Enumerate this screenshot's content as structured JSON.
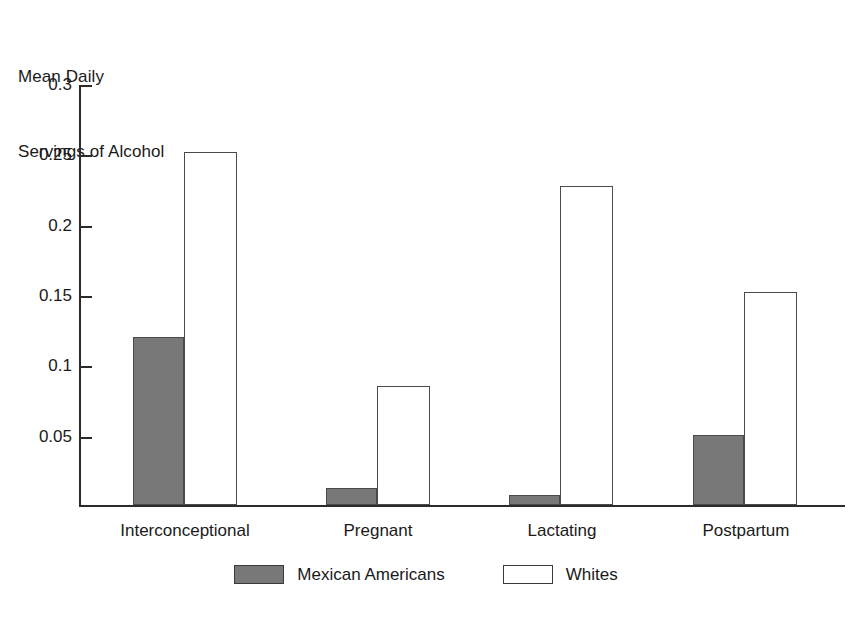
{
  "chart_data": {
    "type": "bar",
    "title": "",
    "ylabel": "Mean Daily Servings of Alcohol",
    "ylabel_line1": "Mean Daily",
    "ylabel_line2": "Servings of Alcohol",
    "xlabel": "",
    "categories": [
      "Interconceptional",
      "Pregnant",
      "Lactating",
      "Postpartum"
    ],
    "ylim": [
      0,
      0.3
    ],
    "ytick_labels": [
      "0.05",
      "0.1",
      "0.15",
      "0.2",
      "0.25",
      "0.3"
    ],
    "ytick_values": [
      0.05,
      0.1,
      0.15,
      0.2,
      0.25,
      0.3
    ],
    "grid": false,
    "legend_position": "bottom-center",
    "series": [
      {
        "name": "Mexican Americans",
        "color": "#787878",
        "style": "filled-gray",
        "values": [
          0.12,
          0.012,
          0.007,
          0.05
        ]
      },
      {
        "name": "Whites",
        "color": "#ffffff",
        "style": "outlined-white",
        "values": [
          0.252,
          0.085,
          0.228,
          0.152
        ]
      }
    ]
  },
  "axis": {
    "line_color": "#2b2b2b"
  },
  "legend": {
    "items": [
      {
        "label": "Mexican Americans",
        "swatch": "gray"
      },
      {
        "label": "Whites",
        "swatch": "white"
      }
    ]
  }
}
